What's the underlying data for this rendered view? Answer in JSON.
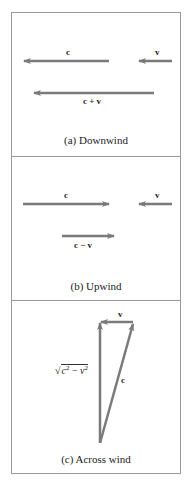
{
  "panels": [
    {
      "id": "a",
      "caption": "(a) Downwind",
      "vectors": [
        {
          "label": "c",
          "direction": "left"
        },
        {
          "label": "v",
          "direction": "left"
        },
        {
          "label": "c + v",
          "direction": "left"
        }
      ]
    },
    {
      "id": "b",
      "caption": "(b) Upwind",
      "vectors": [
        {
          "label": "c",
          "direction": "right"
        },
        {
          "label": "v",
          "direction": "left"
        },
        {
          "label": "c − v",
          "direction": "right"
        }
      ]
    },
    {
      "id": "c",
      "caption": "(c) Across wind",
      "vectors": [
        {
          "label": "v",
          "direction": "left"
        },
        {
          "label": "c",
          "direction": "up-right"
        },
        {
          "label": "√(c² − v²)",
          "direction": "up"
        }
      ],
      "sqrt_parts": {
        "radical": "√",
        "c": "c",
        "exp1": "2",
        "minus": " − ",
        "v": "v",
        "exp2": "2"
      }
    }
  ],
  "colors": {
    "arrow": "#7a7a7a",
    "border": "#9a9a9a",
    "text": "#222222"
  }
}
